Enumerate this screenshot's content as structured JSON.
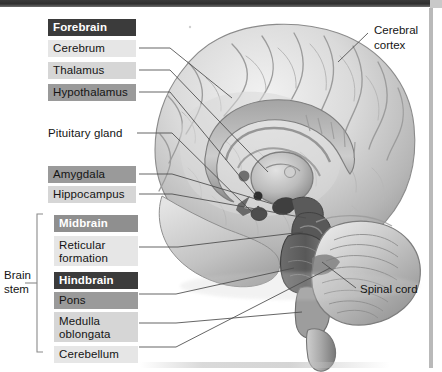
{
  "figure": {
    "kind": "labelled-anatomical-diagram",
    "palette": {
      "chip_dark": "#3b3b3b",
      "chip_mid": "#9a9a9a",
      "chip_light": "#d6d6d6",
      "chip_pale": "#e6e6e6",
      "leader_line": "#4a4a4a",
      "page_background": "#ffffff",
      "brain_light": "#e9e9e9",
      "brain_mid": "#b4b4b4",
      "brain_dark": "#6e6e6e"
    }
  },
  "bracket": {
    "label_line1": "Brain",
    "label_line2": "stem"
  },
  "labels": [
    {
      "id": "forebrain",
      "text": "Forebrain",
      "style": "dark"
    },
    {
      "id": "cerebrum",
      "text": "Cerebrum",
      "style": "pale"
    },
    {
      "id": "thalamus",
      "text": "Thalamus",
      "style": "light"
    },
    {
      "id": "hypothalamus",
      "text": "Hypothalamus",
      "style": "mid"
    },
    {
      "id": "pituitary",
      "text": "Pituitary gland",
      "style": "plain"
    },
    {
      "id": "amygdala",
      "text": "Amygdala",
      "style": "mid"
    },
    {
      "id": "hippocampus",
      "text": "Hippocampus",
      "style": "light"
    },
    {
      "id": "midbrain",
      "text": "Midbrain",
      "style": "midb"
    },
    {
      "id": "reticular",
      "text": "Reticular\nformation",
      "style": "pale"
    },
    {
      "id": "hindbrain",
      "text": "Hindbrain",
      "style": "dark"
    },
    {
      "id": "pons",
      "text": "Pons",
      "style": "mid"
    },
    {
      "id": "medulla",
      "text": "Medulla\noblongata",
      "style": "light"
    },
    {
      "id": "cerebellum",
      "text": "Cerebellum",
      "style": "pale"
    }
  ],
  "side_labels": [
    {
      "id": "cerebral-cortex",
      "line1": "Cerebral",
      "line2": "cortex"
    },
    {
      "id": "spinal-cord",
      "line1": "Spinal cord",
      "line2": ""
    }
  ]
}
